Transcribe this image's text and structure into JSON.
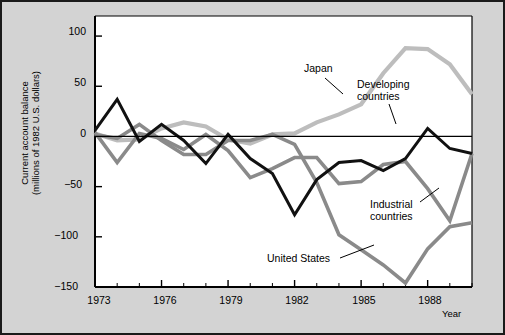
{
  "chart_data": {
    "type": "line",
    "title": "",
    "xlabel": "Year",
    "ylabel": "Current account balance (millions of 1982 U.S. dollars)",
    "ylabel_line1": "Current account balance",
    "ylabel_line2": "(millions of 1982 U.S. dollars)",
    "xlim": [
      1973,
      1990
    ],
    "ylim": [
      -150,
      120
    ],
    "grid": false,
    "legend_position": "inline-annotations",
    "yticks": [
      100,
      50,
      0,
      -50,
      -100,
      -150
    ],
    "ytick_labels": [
      "100",
      "50",
      "0",
      "−50",
      "−100",
      "−150"
    ],
    "xticks": [
      1973,
      1974,
      1975,
      1976,
      1977,
      1978,
      1979,
      1980,
      1981,
      1982,
      1983,
      1984,
      1985,
      1986,
      1987,
      1988,
      1989,
      1990
    ],
    "xtick_labels_shown": [
      "1973",
      "1976",
      "1979",
      "1982",
      "1985",
      "1988"
    ],
    "xtick_labels_shown_values": [
      1973,
      1976,
      1979,
      1982,
      1985,
      1988
    ],
    "zero_line": 0,
    "x": [
      1973,
      1974,
      1975,
      1976,
      1977,
      1978,
      1979,
      1980,
      1981,
      1982,
      1983,
      1984,
      1985,
      1986,
      1987,
      1988,
      1989,
      1990
    ],
    "series": [
      {
        "name": "Developing countries",
        "color": "#111111",
        "values": [
          6,
          37,
          -5,
          12,
          -4,
          -27,
          2,
          -22,
          -37,
          -78,
          -43,
          -26,
          -24,
          -34,
          -22,
          8,
          -12,
          -17
        ]
      },
      {
        "name": "Japan",
        "color": "#bdbdbd",
        "values": [
          3,
          -4,
          -3,
          8,
          14,
          10,
          -3,
          -7,
          2,
          3,
          14,
          22,
          32,
          63,
          88,
          87,
          72,
          42
        ]
      },
      {
        "name": "Industrial countries",
        "color": "#8a8a8a",
        "values": [
          4,
          -26,
          3,
          -2,
          -13,
          2,
          -14,
          -41,
          -32,
          -21,
          -21,
          -47,
          -45,
          -28,
          -25,
          -52,
          -84,
          -17
        ]
      },
      {
        "name": "United States",
        "color": "#8a8a8a",
        "values": [
          2,
          -2,
          12,
          -4,
          -18,
          -18,
          -4,
          -4,
          2,
          -8,
          -46,
          -98,
          -113,
          -128,
          -146,
          -112,
          -90,
          -86
        ]
      }
    ],
    "annotations": [
      {
        "text": "Japan",
        "x": 1978.9,
        "y": 62
      },
      {
        "text": "Developing",
        "x": 1983.0,
        "y": 46,
        "text2": "countries"
      },
      {
        "text": "Industrial",
        "x": 1984.1,
        "y": -57,
        "text2": "countries"
      },
      {
        "text": "United States",
        "x": 1980.4,
        "y": -108
      }
    ]
  },
  "labels": {
    "ylabel_line1": "Current account balance",
    "ylabel_line2": "(millions of 1982 U.S. dollars)",
    "xlabel": "Year",
    "japan": "Japan",
    "developing_1": "Developing",
    "developing_2": "countries",
    "industrial_1": "Industrial",
    "industrial_2": "countries",
    "united_states": "United States",
    "ytick_0": "100",
    "ytick_1": "50",
    "ytick_2": "0",
    "ytick_3": "−50",
    "ytick_4": "−100",
    "ytick_5": "−150",
    "xtick_0": "1973",
    "xtick_1": "1976",
    "xtick_2": "1979",
    "xtick_3": "1982",
    "xtick_4": "1985",
    "xtick_5": "1988"
  },
  "colors": {
    "page_background": "#d3d3d3",
    "plot_background": "#ffffff",
    "border": "#1a1a1a",
    "axis": "#000000",
    "developing": "#111111",
    "japan": "#bdbdbd",
    "industrial": "#8a8a8a",
    "united_states": "#8a8a8a"
  }
}
